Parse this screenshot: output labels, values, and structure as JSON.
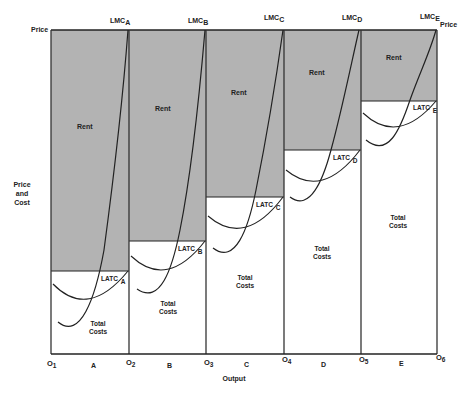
{
  "figure": {
    "y_axis_top_label": "Price",
    "y_axis_label_lines": [
      "Price",
      "and",
      "Cost"
    ],
    "x_axis_label": "Output",
    "right_price_label": "Price",
    "colors": {
      "rent_fill": "#b3b3b3",
      "cost_fill": "#ffffff",
      "line": "#222222",
      "background": "#ffffff"
    },
    "x_ticks": [
      {
        "label": "O",
        "sub": "1"
      },
      {
        "label": "O",
        "sub": "2"
      },
      {
        "label": "O",
        "sub": "3"
      },
      {
        "label": "O",
        "sub": "4"
      },
      {
        "label": "O",
        "sub": "5"
      },
      {
        "label": "O",
        "sub": "6"
      }
    ],
    "firms": [
      {
        "id": "A",
        "lmc_label": "LMC",
        "lmc_sub": "A",
        "latc_label": "LATC",
        "latc_sub": "A",
        "rent_label": "Rent",
        "cost_label_1": "Total",
        "cost_label_2": "Costs"
      },
      {
        "id": "B",
        "lmc_label": "LMC",
        "lmc_sub": "B",
        "latc_label": "LATC",
        "latc_sub": "B",
        "rent_label": "Rent",
        "cost_label_1": "Total",
        "cost_label_2": "Costs"
      },
      {
        "id": "C",
        "lmc_label": "LMC",
        "lmc_sub": "C",
        "latc_label": "LATC",
        "latc_sub": "C",
        "rent_label": "Rent",
        "cost_label_1": "Total",
        "cost_label_2": "Costs"
      },
      {
        "id": "D",
        "lmc_label": "LMC",
        "lmc_sub": "D",
        "latc_label": "LATC",
        "latc_sub": "D",
        "rent_label": "Rent",
        "cost_label_1": "Total",
        "cost_label_2": "Costs"
      },
      {
        "id": "E",
        "lmc_label": "LMC",
        "lmc_sub": "E",
        "latc_label": "LATC",
        "latc_sub": "E",
        "rent_label": "Rent",
        "cost_label_1": "Total",
        "cost_label_2": "Costs"
      }
    ]
  }
}
